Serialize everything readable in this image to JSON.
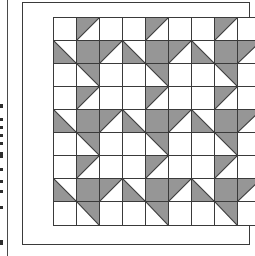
{
  "figure": {
    "kind": "quilt-block-pattern-diagram",
    "grid_columns": 9,
    "grid_rows": 9,
    "cell_size_px": 23,
    "unit_repeat": 3
  },
  "colors": {
    "background": "#ffffff",
    "patch_fill": "#969696",
    "line": "#3a3a3a",
    "margin_rule": "#4a4a4a",
    "edge_mark": "#2e2e2e"
  },
  "frame": {
    "outer_border": true,
    "margin_rule_visible": true
  },
  "edge_marks": [
    {
      "top": 104,
      "height": 4
    },
    {
      "top": 118,
      "height": 3
    },
    {
      "top": 126,
      "height": 3
    },
    {
      "top": 134,
      "height": 3
    },
    {
      "top": 142,
      "height": 3
    },
    {
      "top": 152,
      "height": 6
    },
    {
      "top": 168,
      "height": 3
    },
    {
      "top": 180,
      "height": 3
    },
    {
      "top": 190,
      "height": 3
    },
    {
      "top": 206,
      "height": 3
    },
    {
      "top": 240,
      "height": 5
    }
  ],
  "legend": {
    "patch_label": "shaded half-square triangle",
    "background_label": "background square"
  },
  "chart_data": {
    "type": "heatmap",
    "title": "",
    "xlabel": "",
    "ylabel": "",
    "categories": [
      "c1",
      "c2",
      "c3",
      "c4",
      "c5",
      "c6",
      "c7",
      "c8",
      "c9"
    ],
    "rows": [
      "r1",
      "r2",
      "r3",
      "r4",
      "r5",
      "r6",
      "r7",
      "r8",
      "r9"
    ],
    "legend": [
      "none",
      "tl",
      "tr",
      "bl",
      "br",
      "full"
    ],
    "note": "Each cell value is the shading of that square: none = plain white, tl/tr/bl/br = gray half-square triangle in that corner, full = solid gray square.",
    "cells": [
      [
        "none",
        "tl",
        "none",
        "none",
        "tl",
        "none",
        "none",
        "tl",
        "none"
      ],
      [
        "bl",
        "full",
        "tl",
        "bl",
        "full",
        "tl",
        "bl",
        "full",
        "tl"
      ],
      [
        "none",
        "tr",
        "none",
        "none",
        "tr",
        "none",
        "none",
        "tr",
        "none"
      ],
      [
        "none",
        "tl",
        "none",
        "none",
        "tl",
        "none",
        "none",
        "tl",
        "none"
      ],
      [
        "bl",
        "full",
        "tl",
        "bl",
        "full",
        "tl",
        "bl",
        "full",
        "tl"
      ],
      [
        "none",
        "tr",
        "none",
        "none",
        "tr",
        "none",
        "none",
        "tr",
        "none"
      ],
      [
        "none",
        "tl",
        "none",
        "none",
        "tl",
        "none",
        "none",
        "tl",
        "none"
      ],
      [
        "bl",
        "full",
        "tl",
        "bl",
        "full",
        "tl",
        "bl",
        "full",
        "tl"
      ],
      [
        "none",
        "tr",
        "none",
        "none",
        "tr",
        "none",
        "none",
        "tr",
        "none"
      ]
    ]
  }
}
